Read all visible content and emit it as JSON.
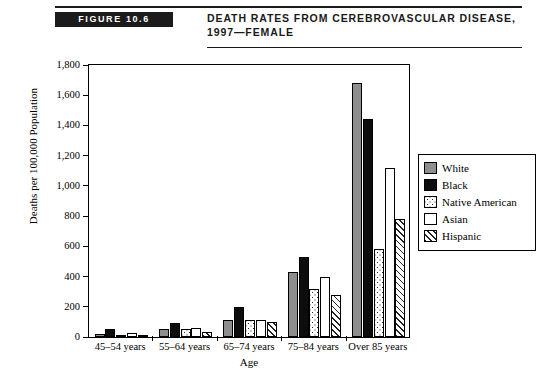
{
  "header": {
    "figure_number": "FIGURE 10.6",
    "title_lines": [
      "DEATH RATES FROM CEREBROVASCULAR DISEASE,",
      "1997—FEMALE"
    ]
  },
  "chart_data": {
    "type": "bar",
    "title": "Death Rates from Cerebrovascular Disease, 1997—Female",
    "xlabel": "Age",
    "ylabel": "Deaths per 100,000 Population",
    "ylim": [
      0,
      1800
    ],
    "yticks": [
      "0",
      "200",
      "400",
      "600",
      "800",
      "1,000",
      "1,200",
      "1,400",
      "1,600",
      "1,800"
    ],
    "ytick_values": [
      0,
      200,
      400,
      600,
      800,
      1000,
      1200,
      1400,
      1600,
      1800
    ],
    "grid": false,
    "legend_position": "right",
    "categories": [
      "45–54 years",
      "55–64 years",
      "65–74 years",
      "75–84 years",
      "Over 85 years"
    ],
    "series": [
      {
        "name": "White",
        "swatch": "solid-gray",
        "color": "#8e8e8e",
        "values": [
          20,
          50,
          110,
          430,
          1680
        ]
      },
      {
        "name": "Black",
        "swatch": "solid-black",
        "color": "#0d0d0d",
        "values": [
          50,
          90,
          200,
          530,
          1440
        ]
      },
      {
        "name": "Native American",
        "swatch": "dotted",
        "color": "#ffffff",
        "values": [
          15,
          55,
          110,
          320,
          580
        ]
      },
      {
        "name": "Asian",
        "swatch": "solid-white",
        "color": "#ffffff",
        "values": [
          25,
          60,
          110,
          400,
          1120
        ]
      },
      {
        "name": "Hispanic",
        "swatch": "diagonal-hatch",
        "color": "#ffffff",
        "values": [
          15,
          30,
          100,
          280,
          780
        ]
      }
    ]
  }
}
